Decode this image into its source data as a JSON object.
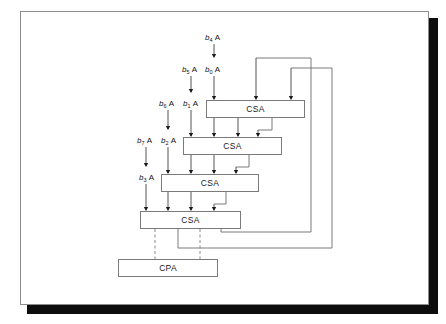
{
  "figure": {
    "type": "block-diagram",
    "background": "#ffffff",
    "line_color": "#7a7a7a",
    "text_color": "#111111"
  },
  "blocks": [
    {
      "id": "csa1",
      "label": "CSA",
      "x": 206,
      "y": 100,
      "w": 99,
      "h": 18
    },
    {
      "id": "csa2",
      "label": "CSA",
      "x": 183,
      "y": 137,
      "w": 99,
      "h": 18
    },
    {
      "id": "csa3",
      "label": "CSA",
      "x": 161,
      "y": 174,
      "w": 98,
      "h": 18
    },
    {
      "id": "csa4",
      "label": "CSA",
      "x": 140,
      "y": 211,
      "w": 101,
      "h": 18
    },
    {
      "id": "cpa",
      "label": "CPA",
      "x": 118,
      "y": 259,
      "w": 100,
      "h": 18
    }
  ],
  "operand_labels": [
    {
      "id": "b4A",
      "base": "b",
      "sub": "4",
      "operand": "A",
      "x": 205,
      "y": 33
    },
    {
      "id": "b5A",
      "base": "b",
      "sub": "5",
      "operand": "A",
      "x": 182,
      "y": 65
    },
    {
      "id": "b0A",
      "base": "b",
      "sub": "0",
      "operand": "A",
      "x": 205,
      "y": 65
    },
    {
      "id": "b6A",
      "base": "b",
      "sub": "6",
      "operand": "A",
      "x": 159,
      "y": 99
    },
    {
      "id": "b1A",
      "base": "b",
      "sub": "1",
      "operand": "A",
      "x": 183,
      "y": 99
    },
    {
      "id": "b7A",
      "base": "b",
      "sub": "7",
      "operand": "A",
      "x": 137,
      "y": 136
    },
    {
      "id": "b2A",
      "base": "b",
      "sub": "2",
      "operand": "A",
      "x": 161,
      "y": 136
    },
    {
      "id": "b3A",
      "base": "b",
      "sub": "3",
      "operand": "A",
      "x": 139,
      "y": 173
    }
  ],
  "connections": {
    "feedback_outer_x": 332,
    "feedback_inner_x": 311,
    "feedback_outer_y": 248,
    "feedback_inner_y": 232,
    "dashed_line_xs": [
      155,
      200
    ]
  }
}
